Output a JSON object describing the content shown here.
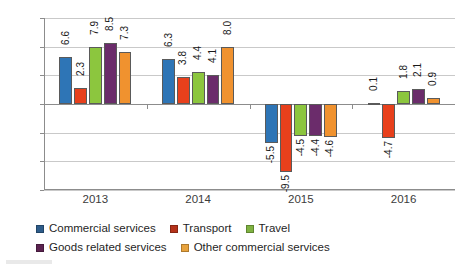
{
  "chart_data": {
    "type": "bar",
    "title": "",
    "subtitle": "",
    "xlabel": "",
    "ylabel": "",
    "categories": [
      "2013",
      "2014",
      "2015",
      "2016"
    ],
    "ylim": [
      -12.0,
      12.0
    ],
    "ytick_labels": [
      "12.0",
      "8.0",
      "4.0",
      "0.0",
      "-4.0",
      "-8.0",
      "-12.0"
    ],
    "ytick_values": [
      12.0,
      8.0,
      4.0,
      0.0,
      -4.0,
      -8.0,
      -12.0
    ],
    "grid": true,
    "legend_position": "bottom-left",
    "series": [
      {
        "name": "Commercial services",
        "color": "#2E75B6",
        "legend_color": "#2E5C8A",
        "values": [
          6.6,
          6.3,
          -5.5,
          0.1
        ],
        "labels": [
          "6.6",
          "6.3",
          "-5.5",
          "0.1"
        ]
      },
      {
        "name": "Transport",
        "color": "#E8401C",
        "legend_color": "#B5321A",
        "values": [
          2.3,
          3.8,
          -9.5,
          -4.7
        ],
        "labels": [
          "2.3",
          "3.8",
          "-9.5",
          "-4.7"
        ]
      },
      {
        "name": "Travel",
        "color": "#8CC63E",
        "legend_color": "#7FB241",
        "values": [
          7.9,
          4.4,
          -4.5,
          1.8
        ],
        "labels": [
          "7.9",
          "4.4",
          "-4.5",
          "1.8"
        ]
      },
      {
        "name": "Goods related services",
        "color": "#6B2C6B",
        "legend_color": "#5B2350",
        "values": [
          8.5,
          4.1,
          -4.4,
          2.1
        ],
        "labels": [
          "8.5",
          "4.1",
          "-4.4",
          "2.1"
        ]
      },
      {
        "name": "Other commercial services",
        "color": "#F0922F",
        "legend_color": "#E8A33D",
        "values": [
          7.3,
          8.0,
          -4.6,
          0.9
        ],
        "labels": [
          "7.3",
          "8.0",
          "-4.6",
          "0.9"
        ]
      }
    ]
  }
}
